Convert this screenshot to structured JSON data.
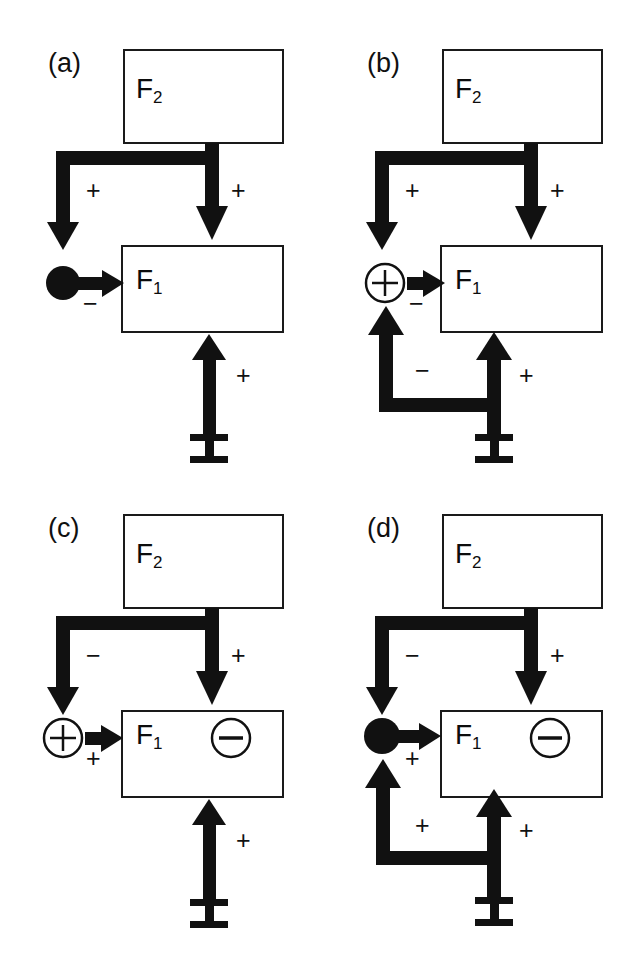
{
  "figure": {
    "background_color": "#ffffff",
    "ink_color": "#111111",
    "box_stroke_color": "#1a1a1a"
  },
  "panels": [
    {
      "id": "a",
      "label": "(a)",
      "upper_block": "F2",
      "upper_block_sub": "2",
      "lower_block": "F1",
      "lower_block_sub": "1",
      "input_symbol": "I",
      "junction_type": "filled-disc",
      "junction_symbol": "",
      "inner_symbol": "",
      "left_branch_sign": "+",
      "right_branch_sign": "+",
      "junction_arrow_sign": "−",
      "input_sign": "+",
      "feedback": false,
      "feedback_left_sign": "",
      "feedback_right_sign": ""
    },
    {
      "id": "b",
      "label": "(b)",
      "upper_block": "F2",
      "upper_block_sub": "2",
      "lower_block": "F1",
      "lower_block_sub": "1",
      "input_symbol": "I",
      "junction_type": "circled-plus",
      "junction_symbol": "+",
      "inner_symbol": "",
      "left_branch_sign": "+",
      "right_branch_sign": "+",
      "junction_arrow_sign": "−",
      "input_sign": "+",
      "feedback": true,
      "feedback_left_sign": "−",
      "feedback_right_sign": "+"
    },
    {
      "id": "c",
      "label": "(c)",
      "upper_block": "F2",
      "upper_block_sub": "2",
      "lower_block": "F1",
      "lower_block_sub": "1",
      "input_symbol": "I",
      "junction_type": "circled-plus",
      "junction_symbol": "+",
      "inner_symbol": "−",
      "left_branch_sign": "−",
      "right_branch_sign": "+",
      "junction_arrow_sign": "+",
      "input_sign": "+",
      "feedback": false,
      "feedback_left_sign": "",
      "feedback_right_sign": ""
    },
    {
      "id": "d",
      "label": "(d)",
      "upper_block": "F2",
      "upper_block_sub": "2",
      "lower_block": "F1",
      "lower_block_sub": "1",
      "input_symbol": "I",
      "junction_type": "filled-disc",
      "junction_symbol": "",
      "inner_symbol": "−",
      "left_branch_sign": "−",
      "right_branch_sign": "+",
      "junction_arrow_sign": "+",
      "input_sign": "+",
      "feedback": true,
      "feedback_left_sign": "+",
      "feedback_right_sign": "+"
    }
  ]
}
